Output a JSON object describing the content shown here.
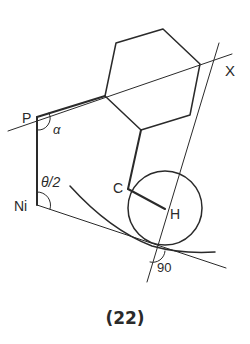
{
  "figure": {
    "caption": "(22)",
    "labels": {
      "P": "P",
      "alpha": "α",
      "theta_half": "θ/2",
      "Ni": "Ni",
      "C": "C",
      "H": "H",
      "X": "X",
      "ninety": "90"
    },
    "colors": {
      "stroke": "#2a2a2a",
      "background": "#ffffff"
    }
  }
}
